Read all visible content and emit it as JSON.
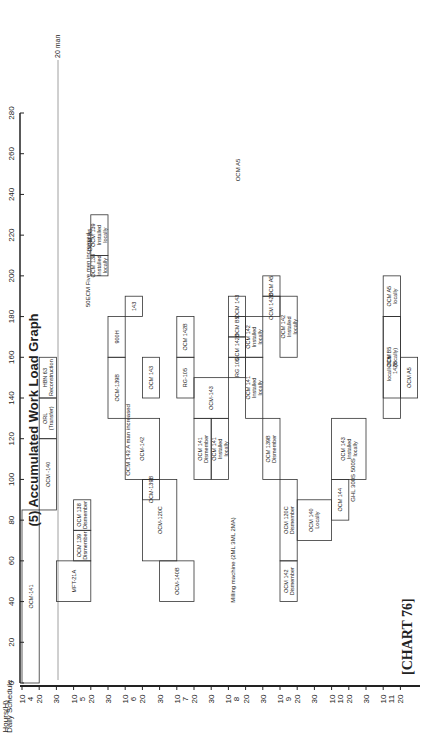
{
  "title": "(5) Accumulated Work Load Graph",
  "caption": "[CHART 76]",
  "chart_data": {
    "type": "area",
    "title": "(5) Accumulated Work Load Graph",
    "ylabel": "Hours (H)",
    "xlabel": "Daily Schedule",
    "ylim": [
      0,
      280
    ],
    "yticks": [
      0,
      20,
      40,
      60,
      80,
      100,
      120,
      140,
      160,
      180,
      200,
      220,
      240,
      260,
      280
    ],
    "xticks_days": [
      "10",
      "20",
      "30",
      "10",
      "20",
      "30",
      "10",
      "20",
      "30",
      "10",
      "20",
      "30",
      "10",
      "20",
      "30",
      "10",
      "20",
      "30",
      "10",
      "20",
      "30",
      "10",
      "20"
    ],
    "months": [
      "4",
      "5",
      "6",
      "7",
      "8",
      "9",
      "10",
      "11"
    ],
    "reference_line": {
      "label": "20 man",
      "value": 180
    },
    "annotations": [
      "OCM 143 A man increased",
      "50ECM Five men increased",
      "Milling machine (2ML 3ML 2MA)",
      "GHL 300S 500S",
      "OCM B5",
      "OCM A5"
    ],
    "blocks": [
      {
        "label": "OCM-141",
        "start": "4/10",
        "end": "4/20",
        "bottom": 0,
        "top": 85
      },
      {
        "label": "OCM -140",
        "start": "4/20",
        "end": "4/30",
        "bottom": 85,
        "top": 120
      },
      {
        "label": "ORL (Transfer)",
        "start": "4/20",
        "end": "4/30",
        "bottom": 120,
        "top": 140
      },
      {
        "label": "HBN 63 Reconstruction",
        "start": "4/20",
        "end": "4/30",
        "bottom": 140,
        "top": 160
      },
      {
        "label": "MFT-21A",
        "start": "4/30",
        "end": "5/20",
        "bottom": 40,
        "top": 60
      },
      {
        "label": "OCM 139 Dismember",
        "start": "5/10",
        "end": "5/20",
        "bottom": 60,
        "top": 75
      },
      {
        "label": "OCM 138 Dismember",
        "start": "5/10",
        "end": "5/20",
        "bottom": 75,
        "top": 90
      },
      {
        "label": "OCM 138 Installed locally",
        "start": "5/20",
        "end": "5/30",
        "bottom": 200,
        "top": 210
      },
      {
        "label": "OCM 139 Installed locally",
        "start": "5/20",
        "end": "5/30",
        "bottom": 210,
        "top": 230
      },
      {
        "label": "900H",
        "start": "5/30",
        "end": "6/10",
        "bottom": 160,
        "top": 180
      },
      {
        "label": "OCM-139B",
        "start": "5/30",
        "end": "6/10",
        "bottom": 130,
        "top": 160
      },
      {
        "label": "143",
        "start": "6/10",
        "end": "6/20",
        "bottom": 180,
        "top": 190
      },
      {
        "label": "OCM-142",
        "start": "6/10",
        "end": "6/30",
        "bottom": 100,
        "top": 130
      },
      {
        "label": "OCM-139B",
        "start": "6/20",
        "end": "6/30",
        "bottom": 90,
        "top": 100
      },
      {
        "label": "OCM-120C",
        "start": "6/20",
        "end": "7/10",
        "bottom": 60,
        "top": 100
      },
      {
        "label": "OCM-140B",
        "start": "6/30",
        "end": "7/20",
        "bottom": 40,
        "top": 60
      },
      {
        "label": "OCM 143",
        "start": "6/20",
        "end": "6/30",
        "bottom": 140,
        "top": 160
      },
      {
        "label": "RG-105",
        "start": "7/10",
        "end": "7/20",
        "bottom": 140,
        "top": 160
      },
      {
        "label": "OCM 142B",
        "start": "7/10",
        "end": "7/20",
        "bottom": 160,
        "top": 180
      },
      {
        "label": "OCM-143",
        "start": "7/20",
        "end": "8/10",
        "bottom": 130,
        "top": 150
      },
      {
        "label": "OCM 141 Dismember",
        "start": "7/20",
        "end": "7/30",
        "bottom": 100,
        "top": 130
      },
      {
        "label": "OCM 141 Installed locally",
        "start": "7/30",
        "end": "8/10",
        "bottom": 100,
        "top": 130
      },
      {
        "label": "RG 105",
        "start": "8/10",
        "end": "8/20",
        "bottom": 150,
        "top": 160
      },
      {
        "label": "OCM 142B",
        "start": "8/10",
        "end": "8/20",
        "bottom": 160,
        "top": 170
      },
      {
        "label": "OCM B5",
        "start": "8/10",
        "end": "8/20",
        "bottom": 170,
        "top": 180
      },
      {
        "label": "OCM 143",
        "start": "8/10",
        "end": "8/20",
        "bottom": 180,
        "top": 190
      },
      {
        "label": "OCM 141 Installed locally",
        "start": "8/20",
        "end": "8/30",
        "bottom": 130,
        "top": 160
      },
      {
        "label": "OCM 142 Installed locally",
        "start": "8/20",
        "end": "8/30",
        "bottom": 160,
        "top": 180
      },
      {
        "label": "OCM 142B",
        "start": "8/30",
        "end": "9/10",
        "bottom": 180,
        "top": 190
      },
      {
        "label": "OCM A5",
        "start": "8/30",
        "end": "9/10",
        "bottom": 190,
        "top": 200
      },
      {
        "label": "OCM 142 Installed locally",
        "start": "9/10",
        "end": "9/20",
        "bottom": 160,
        "top": 190
      },
      {
        "label": "OCM 139B Dismember",
        "start": "8/30",
        "end": "9/10",
        "bottom": 100,
        "top": 130
      },
      {
        "label": "OCM 120C Dismember",
        "start": "9/10",
        "end": "9/20",
        "bottom": 60,
        "top": 100
      },
      {
        "label": "OCM 142 Dismember",
        "start": "9/10",
        "end": "9/20",
        "bottom": 40,
        "top": 60
      },
      {
        "label": "OCM 140 Locally",
        "start": "9/20",
        "end": "10/10",
        "bottom": 70,
        "top": 90
      },
      {
        "label": "OCM 144",
        "start": "10/10",
        "end": "10/20",
        "bottom": 80,
        "top": 100
      },
      {
        "label": "OCM 143 Installed locally",
        "start": "10/10",
        "end": "10/30",
        "bottom": 100,
        "top": 130
      },
      {
        "label": "locall OCM 142B",
        "start": "11/10",
        "end": "11/20",
        "bottom": 130,
        "top": 180
      },
      {
        "label": "OCM A5 locally",
        "start": "11/10",
        "end": "11/20",
        "bottom": 180,
        "top": 200
      },
      {
        "label": "OCM B5 (locally)",
        "start": "11/10",
        "end": "11/20",
        "bottom": 140,
        "top": 180
      },
      {
        "label": "OCM A5",
        "start": "11/20",
        "end": "11/30",
        "bottom": 140,
        "top": 160
      }
    ]
  },
  "axis": {
    "hours_label": "Hours(H)",
    "schedule_label": "Daily Schedule",
    "man_line_label": "20 man"
  }
}
